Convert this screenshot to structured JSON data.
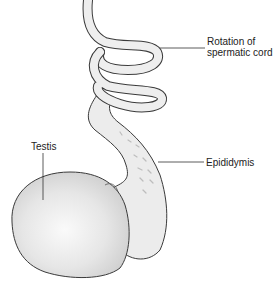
{
  "diagram": {
    "labels": {
      "rotation_line1": "Rotation of",
      "rotation_line2": "spermatic cord",
      "testis": "Testis",
      "epididymis": "Epididymis"
    },
    "colors": {
      "stroke": "#3a3a3a",
      "cord_fill": "#eeeeee",
      "testis_fill": "#e4e4e4",
      "testis_highlight": "#f8f8f8",
      "epididymis_fill": "#ebebeb",
      "leader_line": "#333333"
    }
  }
}
